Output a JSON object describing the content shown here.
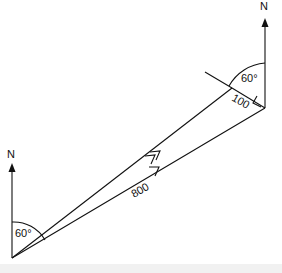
{
  "diagram": {
    "labels": {
      "north_bottom": "N",
      "north_top": "N",
      "angle_bottom": "60°",
      "angle_top": "60°",
      "side_long": "800",
      "side_short": "100"
    }
  }
}
